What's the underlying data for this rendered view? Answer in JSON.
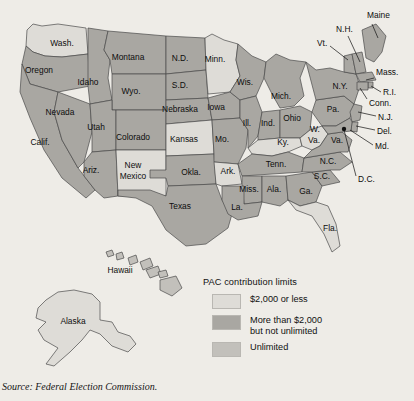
{
  "figure": {
    "source_note": "Source: Federal Election Commission."
  },
  "legend": {
    "title": "PAC contribution limits",
    "items": [
      {
        "label": "$2,000 or less",
        "label2": "",
        "color": "#dedcd7"
      },
      {
        "label": "More than $2,000",
        "label2": "but not unlimited",
        "color": "#a9a7a2"
      },
      {
        "label": "Unlimited",
        "label2": "",
        "color": "#c2c0bb"
      }
    ]
  },
  "colors": {
    "background": "#eeece7",
    "category_low": "#dedcd7",
    "category_mid": "#a9a7a2",
    "category_unlimited": "#c2c0bb",
    "border": "#4a4a4a",
    "text": "#0d0d0d"
  },
  "map": {
    "inset_labels": [
      {
        "name": "hawaii",
        "text": "Hawaii",
        "x": 120,
        "y": 271
      },
      {
        "name": "alaska",
        "text": "Alaska",
        "x": 73,
        "y": 322
      }
    ],
    "states": [
      {
        "code": "WA",
        "label": "Wash.",
        "lx": 62,
        "ly": 44,
        "fill": "#dedcd7"
      },
      {
        "code": "OR",
        "label": "Oregon",
        "lx": 39,
        "ly": 71,
        "fill": "#a9a7a2"
      },
      {
        "code": "ID",
        "label": "Idaho",
        "lx": 88,
        "ly": 83,
        "fill": "#a9a7a2"
      },
      {
        "code": "MT",
        "label": "Montana",
        "lx": 128,
        "ly": 58,
        "fill": "#a9a7a2"
      },
      {
        "code": "ND",
        "label": "N.D.",
        "lx": 180,
        "ly": 59,
        "fill": "#a9a7a2"
      },
      {
        "code": "SD",
        "label": "S.D.",
        "lx": 180,
        "ly": 86,
        "fill": "#a9a7a2"
      },
      {
        "code": "MN",
        "label": "Minn.",
        "lx": 215,
        "ly": 60,
        "fill": "#dedcd7"
      },
      {
        "code": "WI",
        "label": "Wis.",
        "lx": 245,
        "ly": 83,
        "fill": "#a9a7a2"
      },
      {
        "code": "MI",
        "label": "Mich.",
        "lx": 281,
        "ly": 97,
        "fill": "#a9a7a2"
      },
      {
        "code": "NV",
        "label": "Nevada",
        "lx": 60,
        "ly": 113,
        "fill": "#a9a7a2"
      },
      {
        "code": "UT",
        "label": "Utah",
        "lx": 96,
        "ly": 128,
        "fill": "#a9a7a2"
      },
      {
        "code": "WY",
        "label": "Wyo.",
        "lx": 131,
        "ly": 92,
        "fill": "#a9a7a2"
      },
      {
        "code": "NE",
        "label": "Nebraska",
        "lx": 180,
        "ly": 110,
        "fill": "#a9a7a2"
      },
      {
        "code": "IA",
        "label": "Iowa",
        "lx": 216,
        "ly": 108,
        "fill": "#a9a7a2"
      },
      {
        "code": "CA",
        "label": "Calif.",
        "lx": 40,
        "ly": 143,
        "fill": "#a9a7a2"
      },
      {
        "code": "CO",
        "label": "Colorado",
        "lx": 133,
        "ly": 138,
        "fill": "#a9a7a2"
      },
      {
        "code": "KS",
        "label": "Kansas",
        "lx": 184,
        "ly": 140,
        "fill": "#dedcd7"
      },
      {
        "code": "MO",
        "label": "Mo.",
        "lx": 222,
        "ly": 140,
        "fill": "#a9a7a2"
      },
      {
        "code": "IL",
        "label": "Ill.",
        "lx": 247,
        "ly": 124,
        "fill": "#a9a7a2"
      },
      {
        "code": "IN",
        "label": "Ind.",
        "lx": 268,
        "ly": 124,
        "fill": "#a9a7a2"
      },
      {
        "code": "OH",
        "label": "Ohio",
        "lx": 292,
        "ly": 119,
        "fill": "#a9a7a2"
      },
      {
        "code": "AZ",
        "label": "Ariz.",
        "lx": 91,
        "ly": 171,
        "fill": "#a9a7a2"
      },
      {
        "code": "NM",
        "label": "New",
        "lx": 133,
        "ly": 166,
        "fill": "#dedcd7"
      },
      {
        "code": "NM2",
        "label": "Mexico",
        "lx": 133,
        "ly": 177,
        "fill": "#dedcd7"
      },
      {
        "code": "OK",
        "label": "Okla.",
        "lx": 191,
        "ly": 173,
        "fill": "#a9a7a2"
      },
      {
        "code": "AR",
        "label": "Ark.",
        "lx": 228,
        "ly": 172,
        "fill": "#dedcd7"
      },
      {
        "code": "KY",
        "label": "Ky.",
        "lx": 283,
        "ly": 143,
        "fill": "#dedcd7"
      },
      {
        "code": "TN",
        "label": "Tenn.",
        "lx": 276,
        "ly": 165,
        "fill": "#a9a7a2"
      },
      {
        "code": "WV",
        "label": "W.",
        "lx": 315,
        "ly": 130,
        "fill": "#dedcd7"
      },
      {
        "code": "WV2",
        "label": "Va.",
        "lx": 314,
        "ly": 141,
        "fill": "#dedcd7"
      },
      {
        "code": "VA",
        "label": "Va.",
        "lx": 337,
        "ly": 141,
        "fill": "#a9a7a2"
      },
      {
        "code": "PA",
        "label": "Pa.",
        "lx": 333,
        "ly": 110,
        "fill": "#a9a7a2"
      },
      {
        "code": "NY",
        "label": "N.Y.",
        "lx": 340,
        "ly": 87,
        "fill": "#a9a7a2"
      },
      {
        "code": "NC",
        "label": "N.C.",
        "lx": 328,
        "ly": 162,
        "fill": "#a9a7a2"
      },
      {
        "code": "SC",
        "label": "S.C.",
        "lx": 322,
        "ly": 177,
        "fill": "#a9a7a2"
      },
      {
        "code": "GA",
        "label": "Ga.",
        "lx": 306,
        "ly": 192,
        "fill": "#a9a7a2"
      },
      {
        "code": "MS",
        "label": "Miss.",
        "lx": 249,
        "ly": 190,
        "fill": "#a9a7a2"
      },
      {
        "code": "AL",
        "label": "Ala.",
        "lx": 274,
        "ly": 190,
        "fill": "#a9a7a2"
      },
      {
        "code": "LA",
        "label": "La.",
        "lx": 237,
        "ly": 208,
        "fill": "#a9a7a2"
      },
      {
        "code": "TX",
        "label": "Texas",
        "lx": 180,
        "ly": 207,
        "fill": "#a9a7a2"
      },
      {
        "code": "FL",
        "label": "Fla.",
        "lx": 330,
        "ly": 229,
        "fill": "#dedcd7"
      }
    ],
    "callouts": [
      {
        "code": "ME",
        "label": "Maine",
        "tx": 367,
        "ty": 16
      },
      {
        "code": "NH",
        "label": "N.H.",
        "tx": 336,
        "ty": 30
      },
      {
        "code": "VT",
        "label": "Vt.",
        "tx": 317,
        "ty": 44
      },
      {
        "code": "MASS",
        "label": "Mass.",
        "tx": 376,
        "ty": 73
      },
      {
        "code": "RI",
        "label": "R.I.",
        "tx": 383,
        "ty": 93
      },
      {
        "code": "CONN",
        "label": "Conn.",
        "tx": 369,
        "ty": 104
      },
      {
        "code": "NJ",
        "label": "N.J.",
        "tx": 378,
        "ty": 118
      },
      {
        "code": "DEL",
        "label": "Del.",
        "tx": 377,
        "ty": 132
      },
      {
        "code": "MD",
        "label": "Md.",
        "tx": 375,
        "ty": 147
      },
      {
        "code": "DC",
        "label": "D.C.",
        "tx": 358,
        "ty": 180
      }
    ]
  }
}
